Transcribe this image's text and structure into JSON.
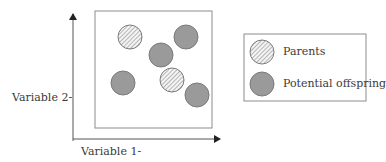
{
  "axes": {
    "x_label": "Variable 1-",
    "y_label": "Variable 2-"
  },
  "legend": {
    "items": [
      {
        "label": "Parents",
        "style": "hatched"
      },
      {
        "label": "Potential offspring",
        "style": "gray"
      }
    ]
  },
  "points": [
    {
      "type": "parent",
      "style": "hatched",
      "cx": 130,
      "cy": 37
    },
    {
      "type": "offspring",
      "style": "gray",
      "cx": 186,
      "cy": 37
    },
    {
      "type": "offspring",
      "style": "gray",
      "cx": 161,
      "cy": 55
    },
    {
      "type": "offspring",
      "style": "gray",
      "cx": 123,
      "cy": 83
    },
    {
      "type": "parent",
      "style": "hatched",
      "cx": 172,
      "cy": 80
    },
    {
      "type": "offspring",
      "style": "gray",
      "cx": 197,
      "cy": 95
    }
  ],
  "colors": {
    "gray_fill": "#9a9a9a",
    "stroke": "#7a7a7a",
    "hatch_line": "#8a8a8a",
    "frame": "#8c8c8c",
    "axis": "#555555"
  }
}
